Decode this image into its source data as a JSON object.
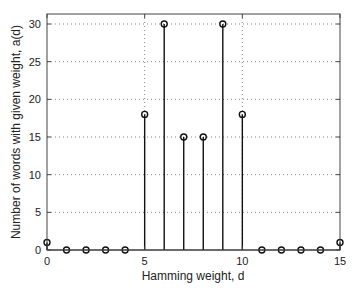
{
  "chart_data": {
    "type": "stem",
    "title": "",
    "xlabel": "Hamming weight, d",
    "ylabel": "Number of words with given weight, a(d)",
    "x": [
      0,
      1,
      2,
      3,
      4,
      5,
      6,
      7,
      8,
      9,
      10,
      11,
      12,
      13,
      14,
      15
    ],
    "values": [
      1,
      0,
      0,
      0,
      0,
      18,
      30,
      15,
      15,
      30,
      18,
      0,
      0,
      0,
      0,
      1
    ],
    "xlim": [
      0,
      15
    ],
    "ylim": [
      0,
      31
    ],
    "xticks": [
      0,
      5,
      10,
      15
    ],
    "yticks": [
      0,
      5,
      10,
      15,
      20,
      25,
      30
    ],
    "grid": true,
    "marker": "circle"
  }
}
